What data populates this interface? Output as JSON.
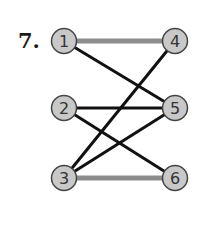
{
  "problem_number": "7.",
  "colors": {
    "node_fill": "#c8c8c8",
    "node_stroke": "#444444",
    "edge_black": "#111111",
    "edge_gray": "#8c8c8c"
  },
  "nodes": [
    {
      "id": "1",
      "x": 64,
      "y": 41
    },
    {
      "id": "2",
      "x": 64,
      "y": 108
    },
    {
      "id": "3",
      "x": 64,
      "y": 178
    },
    {
      "id": "4",
      "x": 175,
      "y": 41
    },
    {
      "id": "5",
      "x": 175,
      "y": 108
    },
    {
      "id": "6",
      "x": 175,
      "y": 178
    }
  ],
  "edges": [
    {
      "from": "1",
      "to": "4",
      "style": "gray"
    },
    {
      "from": "1",
      "to": "5",
      "style": "black"
    },
    {
      "from": "2",
      "to": "5",
      "style": "black"
    },
    {
      "from": "2",
      "to": "6",
      "style": "black"
    },
    {
      "from": "3",
      "to": "4",
      "style": "black"
    },
    {
      "from": "3",
      "to": "5",
      "style": "black"
    },
    {
      "from": "3",
      "to": "6",
      "style": "gray"
    }
  ]
}
